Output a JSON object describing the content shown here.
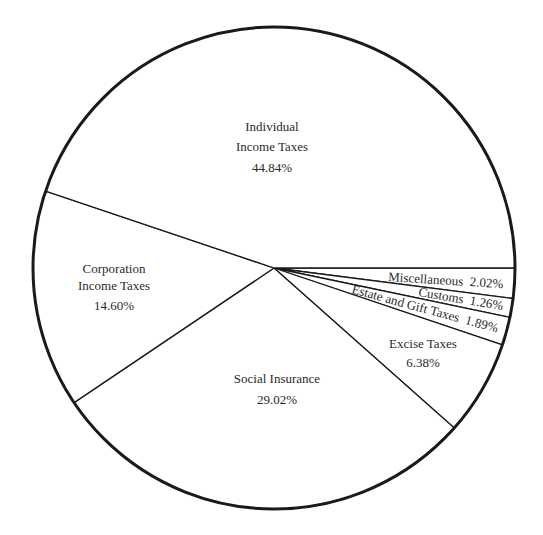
{
  "chart_data": {
    "type": "pie",
    "title": "",
    "start_angle_deg": 0,
    "direction": "clockwise",
    "slices": [
      {
        "name": "Miscellaneous",
        "value": 2.02,
        "label": "Miscellaneous  2.02%"
      },
      {
        "name": "Customs",
        "value": 1.26,
        "label": "Customs  1.26%"
      },
      {
        "name": "Estate and Gift Taxes",
        "value": 1.89,
        "label": "Estate and Gift Taxes  1.89%"
      },
      {
        "name": "Excise Taxes",
        "value": 6.38,
        "label_lines": [
          "Excise Taxes",
          "6.38%"
        ]
      },
      {
        "name": "Social Insurance",
        "value": 29.02,
        "label_lines": [
          "Social Insurance",
          "29.02%"
        ]
      },
      {
        "name": "Corporation Income Taxes",
        "value": 14.6,
        "label_lines": [
          "Corporation",
          "Income Taxes",
          "14.60%"
        ]
      },
      {
        "name": "Individual Income Taxes",
        "value": 44.84,
        "label_lines": [
          "Individual",
          "Income Taxes",
          "44.84%"
        ]
      }
    ],
    "legend": "none",
    "colors": {
      "fill": "#ffffff",
      "stroke": "#1a1a1a"
    }
  }
}
